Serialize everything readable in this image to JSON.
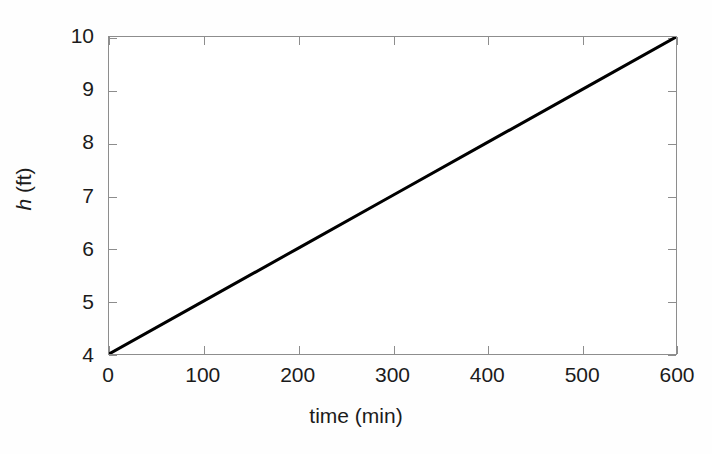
{
  "figure": {
    "background_color": "#fefefe",
    "plot_background_color": "#ffffff",
    "axis_color": "#8d8d8d",
    "line_color": "#000000",
    "text_color": "#1b1b1b"
  },
  "axes": {
    "x_title": "time (min)",
    "y_title_variable": "h",
    "y_title_unit": " (ft)",
    "y_title_full": "h (ft)"
  },
  "chart_data": {
    "type": "line",
    "title": "",
    "subtitle": "",
    "xlabel": "time (min)",
    "ylabel": "h (ft)",
    "xlim": [
      0,
      600
    ],
    "ylim": [
      4,
      10
    ],
    "grid": false,
    "legend": null,
    "legend_position": "none",
    "x_ticks": [
      0,
      100,
      200,
      300,
      400,
      500,
      600
    ],
    "y_ticks": [
      4,
      5,
      6,
      7,
      8,
      9,
      10
    ],
    "x_tick_labels": [
      "0",
      "100",
      "200",
      "300",
      "400",
      "500",
      "600"
    ],
    "y_tick_labels": [
      "4",
      "5",
      "6",
      "7",
      "8",
      "9",
      "10"
    ],
    "tick_direction": "in",
    "box_axes": true,
    "series": [
      {
        "name": "h(t)",
        "style": "solid",
        "color": "#000000",
        "width_px": 3,
        "x": [
          0,
          100,
          200,
          300,
          400,
          500,
          600
        ],
        "values": [
          4,
          5,
          6,
          7,
          8,
          9,
          10
        ]
      }
    ],
    "annotations": []
  }
}
